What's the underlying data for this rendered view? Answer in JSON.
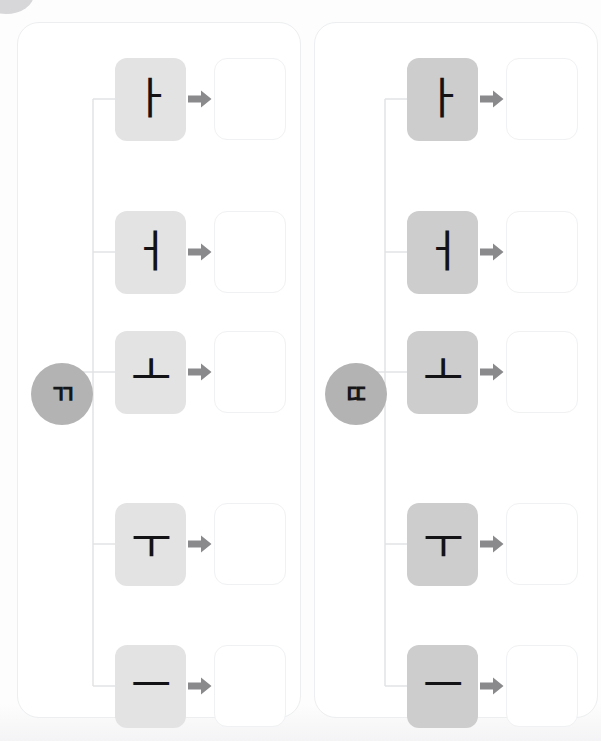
{
  "worksheet": {
    "title": "Hangul syllable building practice",
    "corner_badge": "partial-circle-badge",
    "arrow_icon": "arrow-right-icon",
    "answer_placeholder": ""
  },
  "colors": {
    "page_background": "#fdfdfd",
    "panel_background": "#ffffff",
    "panel_border": "#eceef0",
    "circle_fill": "#b3b3b3",
    "tile_fill_left": "#e3e3e4",
    "tile_fill_right": "#cdcdce",
    "glyph_color": "#131316",
    "arrow_color": "#8a8a8d",
    "connector_line": "#e0e1e4",
    "answer_box_border": "#f0f1f3",
    "corner_badge": "#c9c9cc"
  },
  "panels": [
    {
      "id": "panel-ssang-giyeok",
      "consonant": "ㄲ",
      "consonant_name": "ssang-giyeok",
      "rows": [
        {
          "vowel": "ㅏ",
          "vowel_name": "a",
          "answer": ""
        },
        {
          "vowel": "ㅓ",
          "vowel_name": "eo",
          "answer": ""
        },
        {
          "vowel": "ㅗ",
          "vowel_name": "o",
          "answer": ""
        },
        {
          "vowel": "ㅜ",
          "vowel_name": "u",
          "answer": ""
        },
        {
          "vowel": "ㅡ",
          "vowel_name": "eu",
          "answer": ""
        }
      ]
    },
    {
      "id": "panel-ssang-digeut",
      "consonant": "ㄸ",
      "consonant_name": "ssang-digeut",
      "rows": [
        {
          "vowel": "ㅏ",
          "vowel_name": "a",
          "answer": ""
        },
        {
          "vowel": "ㅓ",
          "vowel_name": "eo",
          "answer": ""
        },
        {
          "vowel": "ㅗ",
          "vowel_name": "o",
          "answer": ""
        },
        {
          "vowel": "ㅜ",
          "vowel_name": "u",
          "answer": ""
        },
        {
          "vowel": "ㅡ",
          "vowel_name": "eu",
          "answer": ""
        }
      ]
    }
  ],
  "row_tops": [
    33,
    186,
    330,
    478,
    620
  ]
}
